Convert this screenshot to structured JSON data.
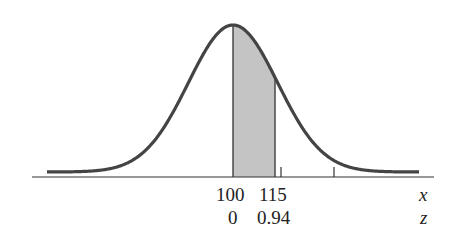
{
  "chart_data": {
    "type": "area",
    "title": "",
    "mean": 100,
    "z_at_115": 0.94,
    "shaded_region": {
      "x_from": 100,
      "x_to": 115,
      "z_from": 0,
      "z_to": 0.94
    },
    "x_tick_labels": [
      "100",
      "115"
    ],
    "z_tick_labels": [
      "0",
      "0.94"
    ],
    "xlabel": "x",
    "zlabel": "z",
    "grid": false,
    "colors": {
      "curve": "#444444",
      "shade": "#c4c4c4",
      "axis": "#333333"
    }
  },
  "labels": {
    "x_axis_name": "x",
    "z_axis_name": "z",
    "x_mean": "100",
    "x_value": "115",
    "z_mean": "0",
    "z_value": "0.94"
  }
}
